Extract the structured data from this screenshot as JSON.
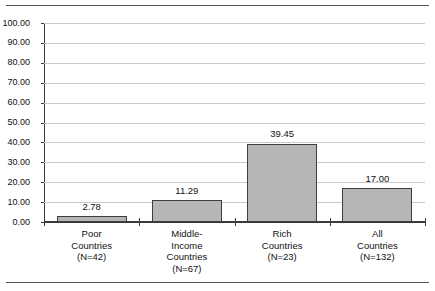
{
  "figure": {
    "clipped_title_remnant": "",
    "background_color": "#ffffff",
    "rule_color": "#555555"
  },
  "chart_data": {
    "type": "bar",
    "title": "",
    "subtitle": "",
    "xlabel": "",
    "ylabel": "",
    "categories": [
      "Poor Countries (N=42)",
      "Middle-Income Countries (N=67)",
      "Rich Countries (N=23)",
      "All Countries (N=132)"
    ],
    "category_lines": [
      [
        "Poor",
        "Countries",
        "(N=42)"
      ],
      [
        "Middle-",
        "Income",
        "Countries",
        "(N=67)"
      ],
      [
        "Rich",
        "Countries",
        "(N=23)"
      ],
      [
        "All",
        "Countries",
        "(N=132)"
      ]
    ],
    "values": [
      2.78,
      11.29,
      39.45,
      17.0
    ],
    "value_labels": [
      "2.78",
      "11.29",
      "39.45",
      "17.00"
    ],
    "ylim": [
      0,
      100
    ],
    "ytick_values": [
      100,
      90,
      80,
      70,
      60,
      50,
      40,
      30,
      20,
      10,
      0
    ],
    "ytick_labels": [
      "100.00",
      "90.00",
      "80.00",
      "70.00",
      "60.00",
      "50.00",
      "40.00",
      "30.00",
      "20.00",
      "10.00",
      "0.00"
    ],
    "grid": true,
    "grid_color": "#c9c9c9",
    "legend": null,
    "legend_position": "none",
    "bar_fill_color": "#b6b6b6",
    "bar_border_color": "#3d3d3d",
    "axis_color": "#3a3a3a"
  }
}
